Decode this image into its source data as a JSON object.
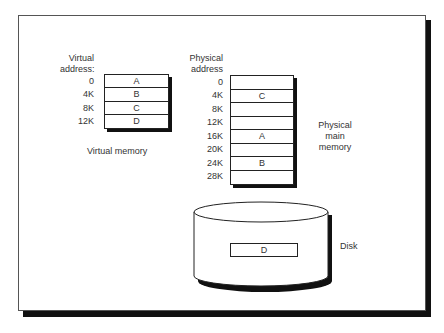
{
  "virtual": {
    "title_line1": "Virtual",
    "title_line2": "address:",
    "caption": "Virtual memory",
    "rows": [
      {
        "addr": "0",
        "content": "A"
      },
      {
        "addr": "4K",
        "content": "B"
      },
      {
        "addr": "8K",
        "content": "C"
      },
      {
        "addr": "12K",
        "content": "D"
      }
    ]
  },
  "physical": {
    "title_line1": "Physical",
    "title_line2": "address",
    "caption_line1": "Physical",
    "caption_line2": "main",
    "caption_line3": "memory",
    "rows": [
      {
        "addr": "0",
        "content": ""
      },
      {
        "addr": "4K",
        "content": "C"
      },
      {
        "addr": "8K",
        "content": ""
      },
      {
        "addr": "12K",
        "content": ""
      },
      {
        "addr": "16K",
        "content": "A"
      },
      {
        "addr": "20K",
        "content": ""
      },
      {
        "addr": "24K",
        "content": "B"
      },
      {
        "addr": "28K",
        "content": ""
      }
    ]
  },
  "disk": {
    "label": "Disk",
    "content": "D"
  }
}
